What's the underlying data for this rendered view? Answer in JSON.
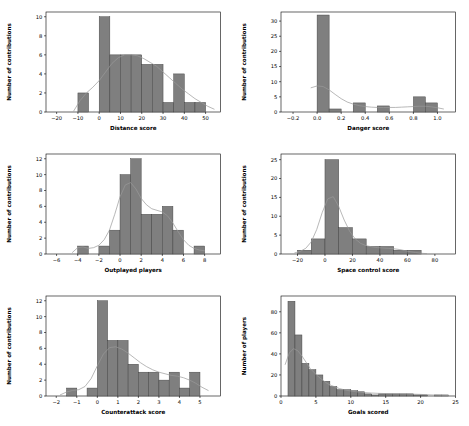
{
  "figure": {
    "rows": 3,
    "cols": 2,
    "background": "#ffffff",
    "bar_color": "#7f7f7f",
    "bar_edge_color": "#3f3f3f",
    "kde_color": "#9a9a9a"
  },
  "chart_data": [
    {
      "type": "bar",
      "id": "distance-score",
      "title": "",
      "xlabel": "Distance score",
      "ylabel": "Number of contributions",
      "xlim": [
        -25,
        57
      ],
      "ylim": [
        0,
        10.5
      ],
      "xticks": [
        -20,
        -10,
        0,
        10,
        20,
        30,
        40,
        50
      ],
      "yticks": [
        0,
        2,
        4,
        6,
        8,
        10
      ],
      "grid": false,
      "legend": "none",
      "bin_edges": [
        -10,
        -5,
        0,
        5,
        10,
        15,
        20,
        25,
        30,
        35,
        40,
        45,
        50
      ],
      "values": [
        2,
        0,
        10,
        6,
        6,
        6,
        5,
        5,
        1,
        4,
        1,
        1
      ],
      "kde": {
        "x": [
          -12,
          -9,
          -6,
          -3,
          0,
          3,
          6,
          9,
          12,
          15,
          18,
          21,
          24,
          27,
          30,
          33,
          36,
          39,
          42,
          45,
          48,
          51,
          54
        ],
        "y": [
          0.1,
          1.2,
          2.0,
          2.6,
          3.3,
          4.2,
          5.1,
          5.7,
          6.0,
          6.0,
          5.9,
          5.6,
          5.2,
          4.8,
          4.2,
          3.6,
          3.0,
          2.4,
          1.9,
          1.4,
          1.0,
          0.6,
          0.3
        ]
      }
    },
    {
      "type": "bar",
      "id": "danger-score",
      "title": "",
      "xlabel": "Danger score",
      "ylabel": "Number of contributions",
      "xlim": [
        -0.3,
        1.15
      ],
      "ylim": [
        0,
        33
      ],
      "xticks": [
        -0.2,
        0.0,
        0.2,
        0.4,
        0.6,
        0.8,
        1.0
      ],
      "yticks": [
        0,
        5,
        10,
        15,
        20,
        25,
        30
      ],
      "grid": false,
      "legend": "none",
      "bin_edges": [
        0.0,
        0.1,
        0.2,
        0.3,
        0.4,
        0.5,
        0.6,
        0.7,
        0.8,
        0.9,
        1.0
      ],
      "values": [
        32,
        1,
        0,
        3,
        0,
        2,
        0,
        0,
        5,
        3
      ],
      "kde": {
        "x": [
          -0.05,
          0.0,
          0.05,
          0.1,
          0.15,
          0.2,
          0.25,
          0.3,
          0.35,
          0.4,
          0.45,
          0.5,
          0.55,
          0.6,
          0.65,
          0.7,
          0.75,
          0.8,
          0.85,
          0.9,
          0.95,
          1.0,
          1.05
        ],
        "y": [
          8.0,
          8.6,
          8.4,
          7.3,
          5.8,
          4.4,
          3.3,
          2.6,
          2.1,
          1.8,
          1.6,
          1.5,
          1.5,
          1.5,
          1.5,
          1.6,
          1.7,
          1.8,
          1.9,
          1.9,
          1.7,
          1.4,
          1.0
        ]
      }
    },
    {
      "type": "bar",
      "id": "outplayed-players",
      "title": "",
      "xlabel": "Outplayed players",
      "ylabel": "Number of contributions",
      "xlim": [
        -7,
        9.5
      ],
      "ylim": [
        0,
        12.6
      ],
      "xticks": [
        -6,
        -4,
        -2,
        0,
        2,
        4,
        6,
        8
      ],
      "yticks": [
        0,
        2,
        4,
        6,
        8,
        10,
        12
      ],
      "grid": false,
      "legend": "none",
      "bin_edges": [
        -4,
        -3,
        -2,
        -1,
        0,
        1,
        2,
        3,
        4,
        5,
        6,
        7,
        8
      ],
      "values": [
        1,
        0,
        1,
        3,
        10,
        12,
        5,
        5,
        6,
        3,
        0,
        1
      ],
      "kde": {
        "x": [
          -4.5,
          -4,
          -3.5,
          -3,
          -2.5,
          -2,
          -1.5,
          -1,
          -0.5,
          0,
          0.5,
          1,
          1.5,
          2,
          2.5,
          3,
          3.5,
          4,
          4.5,
          5,
          5.5,
          6,
          6.5,
          7,
          7.5,
          8
        ],
        "y": [
          0.2,
          0.8,
          0.9,
          0.7,
          0.8,
          1.1,
          1.8,
          3.0,
          5.0,
          7.2,
          8.7,
          9.0,
          8.2,
          7.0,
          6.2,
          5.7,
          5.5,
          5.3,
          4.8,
          3.9,
          2.8,
          1.8,
          1.1,
          0.7,
          0.5,
          0.4
        ]
      }
    },
    {
      "type": "bar",
      "id": "space-control-score",
      "title": "",
      "xlabel": "Space control score",
      "ylabel": "Number of contributions",
      "xlim": [
        -32,
        95
      ],
      "ylim": [
        0,
        26.5
      ],
      "xticks": [
        -20,
        0,
        20,
        40,
        60,
        80
      ],
      "yticks": [
        0,
        5,
        10,
        15,
        20,
        25
      ],
      "grid": false,
      "legend": "none",
      "bin_edges": [
        -20,
        -10,
        0,
        10,
        20,
        30,
        40,
        50,
        60,
        70
      ],
      "values": [
        1,
        4,
        25,
        7,
        4,
        2,
        2,
        1,
        1
      ],
      "kde": {
        "x": [
          -22,
          -18,
          -14,
          -10,
          -6,
          -2,
          2,
          6,
          10,
          14,
          18,
          22,
          26,
          30,
          34,
          38,
          42,
          46,
          50,
          54,
          58,
          62,
          66,
          70,
          74
        ],
        "y": [
          0.3,
          0.7,
          1.5,
          3.2,
          6.5,
          11.0,
          14.6,
          15.2,
          12.6,
          9.0,
          6.0,
          4.0,
          2.8,
          2.2,
          1.9,
          1.7,
          1.6,
          1.5,
          1.4,
          1.2,
          0.9,
          0.6,
          0.4,
          0.2,
          0.1
        ]
      }
    },
    {
      "type": "bar",
      "id": "counterattack-score",
      "title": "",
      "xlabel": "Counterattack score",
      "ylabel": "Number of contributions",
      "xlim": [
        -2.5,
        6.0
      ],
      "ylim": [
        0,
        12.6
      ],
      "xticks": [
        -2,
        -1,
        0,
        1,
        2,
        3,
        4,
        5
      ],
      "yticks": [
        0,
        2,
        4,
        6,
        8,
        10,
        12
      ],
      "grid": false,
      "legend": "none",
      "bin_edges": [
        -1.5,
        -1.0,
        -0.5,
        0.0,
        0.5,
        1.0,
        1.5,
        2.0,
        2.5,
        3.0,
        3.5,
        4.0,
        4.5,
        5.0
      ],
      "values": [
        1,
        0,
        1,
        12,
        7,
        7,
        4,
        3,
        3,
        2,
        3,
        1,
        3
      ],
      "kde": {
        "x": [
          -1.8,
          -1.5,
          -1.2,
          -0.9,
          -0.6,
          -0.3,
          0.0,
          0.3,
          0.6,
          0.9,
          1.2,
          1.5,
          1.8,
          2.1,
          2.4,
          2.7,
          3.0,
          3.3,
          3.6,
          3.9,
          4.2,
          4.5,
          4.8,
          5.1,
          5.4
        ],
        "y": [
          0.15,
          0.5,
          0.7,
          0.8,
          1.2,
          2.2,
          3.8,
          5.3,
          6.1,
          6.2,
          5.9,
          5.4,
          4.8,
          4.2,
          3.7,
          3.3,
          3.0,
          2.8,
          2.6,
          2.5,
          2.3,
          2.0,
          1.6,
          1.1,
          0.7
        ]
      }
    },
    {
      "type": "bar",
      "id": "goals-scored",
      "title": "",
      "xlabel": "Goals scored",
      "ylabel": "Number of players",
      "xlim": [
        0,
        25
      ],
      "ylim": [
        0,
        95
      ],
      "xticks": [
        0,
        5,
        10,
        15,
        20,
        25
      ],
      "yticks": [
        0,
        20,
        40,
        60,
        80
      ],
      "grid": false,
      "legend": "none",
      "bin_edges": [
        1,
        2,
        3,
        4,
        5,
        6,
        7,
        8,
        9,
        10,
        11,
        12,
        13,
        14,
        15,
        16,
        17,
        18,
        19,
        20,
        21,
        22,
        23,
        24
      ],
      "values": [
        90,
        58,
        31,
        25,
        20,
        14,
        9,
        6,
        6,
        5,
        4,
        2,
        1,
        2,
        2,
        2,
        2,
        2,
        1,
        1,
        0,
        1,
        1
      ],
      "kde": {
        "x": [
          0.6,
          1.2,
          1.8,
          2.4,
          3.0,
          3.6,
          4.2,
          4.8,
          5.4,
          6.0,
          6.6,
          7.2,
          7.8,
          8.4,
          9.0,
          9.6,
          10.2,
          10.8,
          11.4,
          12.0,
          13.0,
          14.0,
          15.0,
          16.0,
          17.0,
          18.0,
          19.0,
          20.0,
          21.0,
          22.0,
          23.0,
          24.0
        ],
        "y": [
          30,
          41,
          45,
          43,
          38,
          32,
          26,
          22,
          18,
          15,
          12,
          10,
          8.5,
          7,
          6,
          5.2,
          4.6,
          4.0,
          3.6,
          3.2,
          2.8,
          2.5,
          2.3,
          2.1,
          2.0,
          1.9,
          1.7,
          1.5,
          1.2,
          0.9,
          0.6,
          0.4
        ]
      }
    }
  ]
}
